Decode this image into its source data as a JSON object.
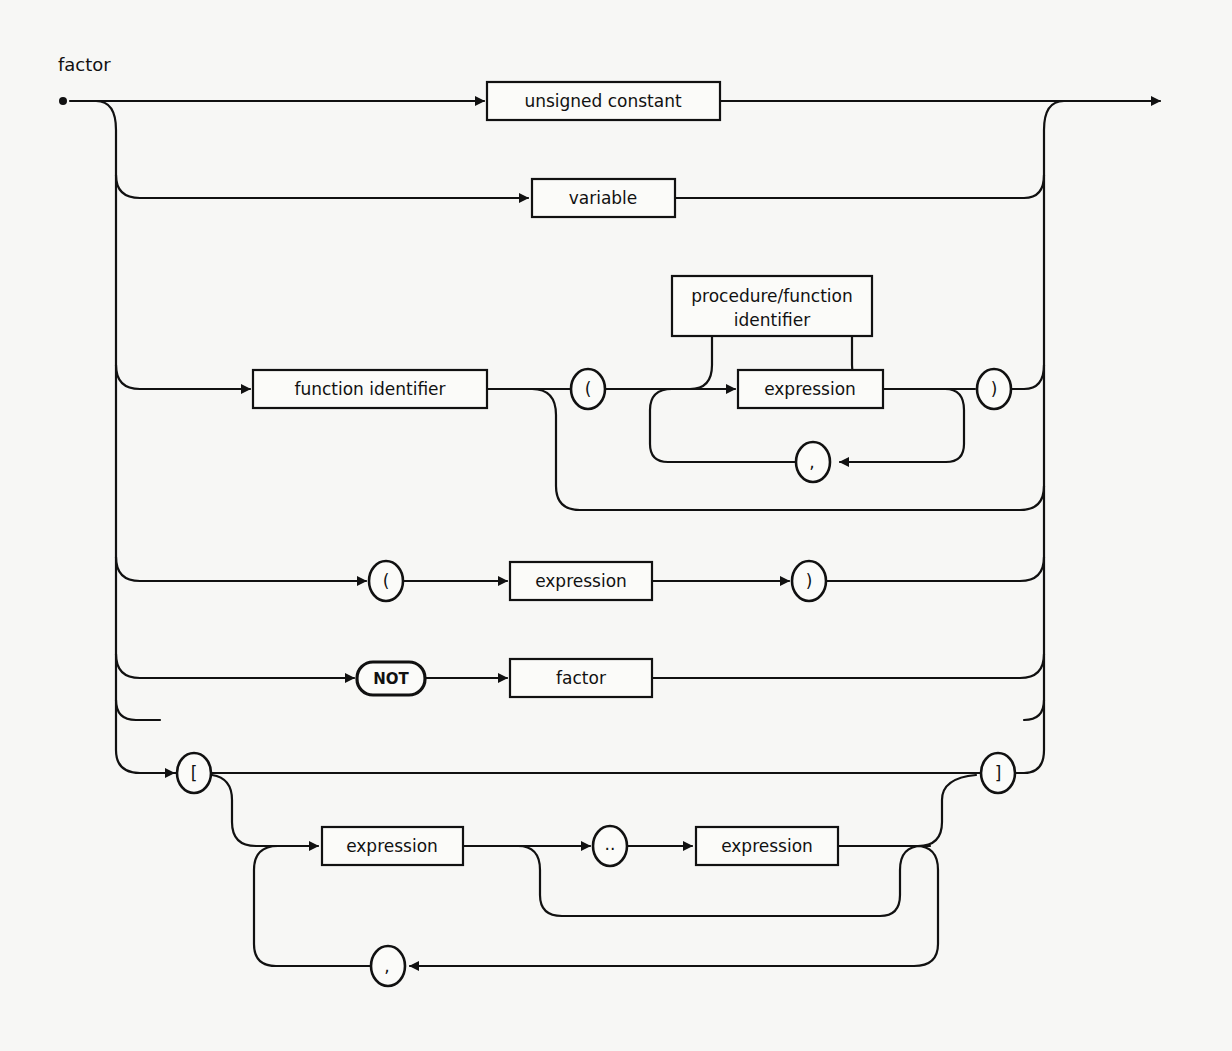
{
  "diagram": {
    "title": "factor",
    "nonterminals": {
      "unsigned_constant": "unsigned constant",
      "variable": "variable",
      "function_identifier": "function identifier",
      "proc_func_identifier_line1": "procedure/function",
      "proc_func_identifier_line2": "identifier",
      "expression_args": "expression",
      "expression_paren": "expression",
      "factor": "factor",
      "expression_set_low": "expression",
      "expression_set_high": "expression"
    },
    "terminals": {
      "lparen_call": "(",
      "rparen_call": ")",
      "comma_call": ",",
      "lparen": "(",
      "rparen": ")",
      "not": "NOT",
      "lbracket": "[",
      "rbracket": "]",
      "range": "..",
      "comma_set": ","
    },
    "colors": {
      "stroke": "#111111",
      "background": "#f7f7f5"
    }
  }
}
